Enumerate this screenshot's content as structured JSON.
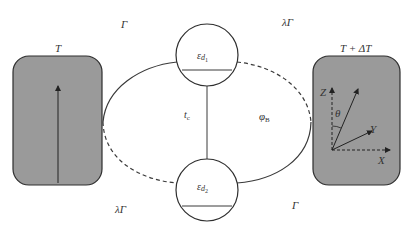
{
  "diagram": {
    "type": "double quantum dot thermoelectric setup",
    "colors": {
      "reservoir_fill": "#9a9a9a",
      "stroke": "#3a3a3a",
      "text": "#333333",
      "background": "#ffffff"
    },
    "left_reservoir": {
      "label": "T"
    },
    "right_reservoir": {
      "label": "T + ΔT"
    },
    "dot_top": {
      "label_main": "ε",
      "label_sub": "d",
      "label_subsub": "1"
    },
    "dot_bottom": {
      "label_main": "ε",
      "label_sub": "d",
      "label_subsub": "2"
    },
    "couplings": {
      "top_left": "Γ",
      "top_right": "λΓ",
      "bottom_left": "λΓ",
      "bottom_right": "Γ"
    },
    "interdot": {
      "main": "t",
      "sub": "c"
    },
    "flux": {
      "main": "φ",
      "sub": "B"
    },
    "axes": {
      "z": "Z",
      "x": "X",
      "y": "Y",
      "angle": "θ"
    }
  }
}
